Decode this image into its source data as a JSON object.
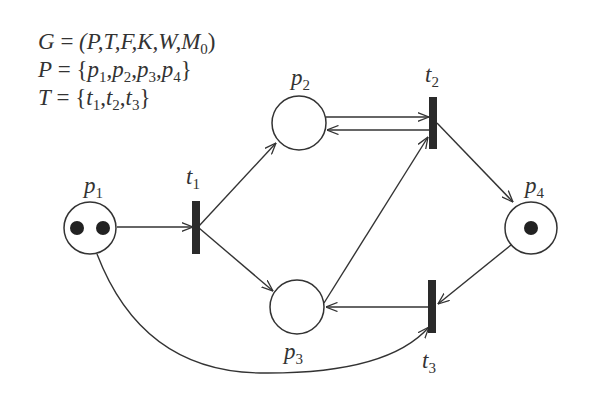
{
  "definitions": {
    "line1": {
      "lhs": "G",
      "eq": " = ",
      "rhs": "(P,T,F,K,W,M",
      "sub": "0",
      "close": ")"
    },
    "line2": {
      "lhs": "P",
      "eq": " = ",
      "items": [
        "p1",
        "p2",
        "p3",
        "p4"
      ]
    },
    "line3": {
      "lhs": "T",
      "eq": " = ",
      "items": [
        "t1",
        "t2",
        "t3"
      ]
    }
  },
  "places": [
    {
      "id": "p1",
      "base": "p",
      "sub": "1",
      "tokens": 2
    },
    {
      "id": "p2",
      "base": "p",
      "sub": "2",
      "tokens": 0
    },
    {
      "id": "p3",
      "base": "p",
      "sub": "3",
      "tokens": 0
    },
    {
      "id": "p4",
      "base": "p",
      "sub": "4",
      "tokens": 1
    }
  ],
  "transitions": [
    {
      "id": "t1",
      "base": "t",
      "sub": "1"
    },
    {
      "id": "t2",
      "base": "t",
      "sub": "2"
    },
    {
      "id": "t3",
      "base": "t",
      "sub": "3"
    }
  ],
  "arcs": [
    {
      "from": "p1",
      "to": "t1"
    },
    {
      "from": "t1",
      "to": "p2"
    },
    {
      "from": "t1",
      "to": "p3"
    },
    {
      "from": "p2",
      "to": "t2"
    },
    {
      "from": "t2",
      "to": "p2"
    },
    {
      "from": "p3",
      "to": "t2"
    },
    {
      "from": "t2",
      "to": "p4"
    },
    {
      "from": "p4",
      "to": "t3"
    },
    {
      "from": "t3",
      "to": "p3"
    },
    {
      "from": "p1",
      "to": "t3"
    }
  ],
  "colors": {
    "ink": "#333333",
    "background": "#ffffff"
  }
}
